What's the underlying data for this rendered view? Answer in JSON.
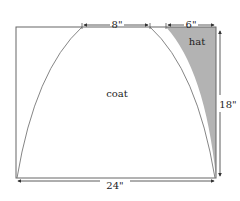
{
  "diagram": {
    "labels": {
      "coat": "coat",
      "hat": "hat"
    },
    "dimensions": {
      "top_width": "8\"",
      "hat_width": "6\"",
      "height": "18\"",
      "bottom_width": "24\""
    },
    "colors": {
      "outline": "#555555",
      "hat_fill": "#b3b3b3",
      "background": "#ffffff"
    }
  }
}
